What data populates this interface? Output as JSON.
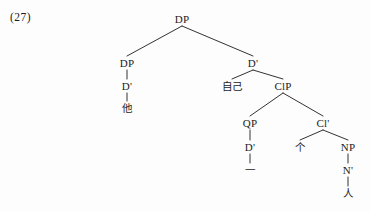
{
  "figure": {
    "example_number": "(27)",
    "ink_color": "#1c1c1c",
    "background_color": "#fdfdfd",
    "width": 370,
    "height": 212
  },
  "nodes": [
    {
      "id": "dp_root",
      "label": "DP",
      "kind": "category",
      "x": 182,
      "y": 19
    },
    {
      "id": "dp_left",
      "label": "DP",
      "kind": "category",
      "x": 127,
      "y": 63
    },
    {
      "id": "d_bar_left",
      "label": "D'",
      "kind": "category",
      "x": 127,
      "y": 86
    },
    {
      "id": "ta",
      "label": "他",
      "kind": "terminal",
      "x": 127,
      "y": 108
    },
    {
      "id": "d_bar_rt",
      "label": "D'",
      "kind": "category",
      "x": 253,
      "y": 63
    },
    {
      "id": "ziji",
      "label": "自己",
      "kind": "terminal",
      "x": 232,
      "y": 86
    },
    {
      "id": "clp",
      "label": "ClP",
      "kind": "category",
      "x": 283,
      "y": 86
    },
    {
      "id": "qp",
      "label": "QP",
      "kind": "category",
      "x": 250,
      "y": 123
    },
    {
      "id": "d_bar_qp",
      "label": "D'",
      "kind": "category",
      "x": 250,
      "y": 147
    },
    {
      "id": "yi",
      "label": "一",
      "kind": "terminal",
      "x": 250,
      "y": 170
    },
    {
      "id": "cl_bar",
      "label": "Cl'",
      "kind": "category",
      "x": 323,
      "y": 123
    },
    {
      "id": "ge",
      "label": "个",
      "kind": "terminal",
      "x": 300,
      "y": 147
    },
    {
      "id": "np",
      "label": "NP",
      "kind": "category",
      "x": 348,
      "y": 147
    },
    {
      "id": "n_bar",
      "label": "N'",
      "kind": "category",
      "x": 348,
      "y": 170
    },
    {
      "id": "ren",
      "label": "人",
      "kind": "terminal",
      "x": 348,
      "y": 193
    }
  ],
  "edges": [
    {
      "from": "dp_root",
      "to": "dp_left"
    },
    {
      "from": "dp_root",
      "to": "d_bar_rt"
    },
    {
      "from": "dp_left",
      "to": "d_bar_left"
    },
    {
      "from": "d_bar_left",
      "to": "ta"
    },
    {
      "from": "d_bar_rt",
      "to": "ziji"
    },
    {
      "from": "d_bar_rt",
      "to": "clp"
    },
    {
      "from": "clp",
      "to": "qp"
    },
    {
      "from": "clp",
      "to": "cl_bar"
    },
    {
      "from": "qp",
      "to": "d_bar_qp"
    },
    {
      "from": "d_bar_qp",
      "to": "yi"
    },
    {
      "from": "cl_bar",
      "to": "ge"
    },
    {
      "from": "cl_bar",
      "to": "np"
    },
    {
      "from": "np",
      "to": "n_bar"
    },
    {
      "from": "n_bar",
      "to": "ren"
    }
  ]
}
